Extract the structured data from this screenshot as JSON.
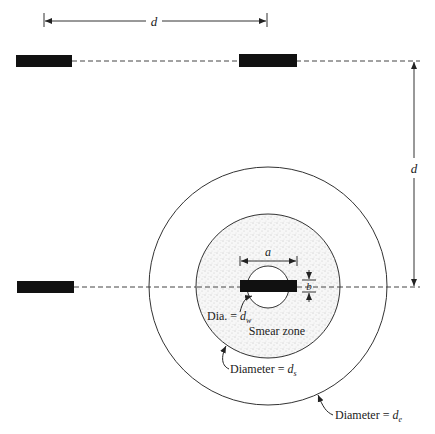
{
  "diagram": {
    "type": "drain-layout-plan-view",
    "colors": {
      "ink": "#111111",
      "line": "#333333",
      "smear_fill": "#eeeeee",
      "background": "#ffffff"
    },
    "spacing_labels": {
      "horizontal": "d",
      "vertical": "d"
    },
    "drain_dimensions": {
      "width_label": "a",
      "thickness_label": "b"
    },
    "labels": {
      "well_diameter_prefix": "Dia. = ",
      "well_diameter_symbol": "d",
      "well_diameter_sub": "w",
      "smear_zone": "Smear zone",
      "smear_diameter_prefix": "Diameter = ",
      "smear_diameter_symbol": "d",
      "smear_diameter_sub": "s",
      "influence_diameter_prefix": "Diameter = ",
      "influence_diameter_symbol": "d",
      "influence_diameter_sub": "e"
    },
    "drains": [
      {
        "id": "top-left",
        "x": 16,
        "y": 55,
        "w": 56,
        "h": 12
      },
      {
        "id": "top-right",
        "x": 239,
        "y": 54,
        "w": 58,
        "h": 13
      },
      {
        "id": "bottom-left",
        "x": 17,
        "y": 281,
        "w": 57,
        "h": 12
      },
      {
        "id": "center",
        "x": 240,
        "y": 280,
        "w": 57,
        "h": 12
      }
    ],
    "circles": {
      "center": {
        "cx": 268,
        "cy": 286
      },
      "influence_radius": 119,
      "smear_radius": 72,
      "well_radius": 21
    }
  }
}
